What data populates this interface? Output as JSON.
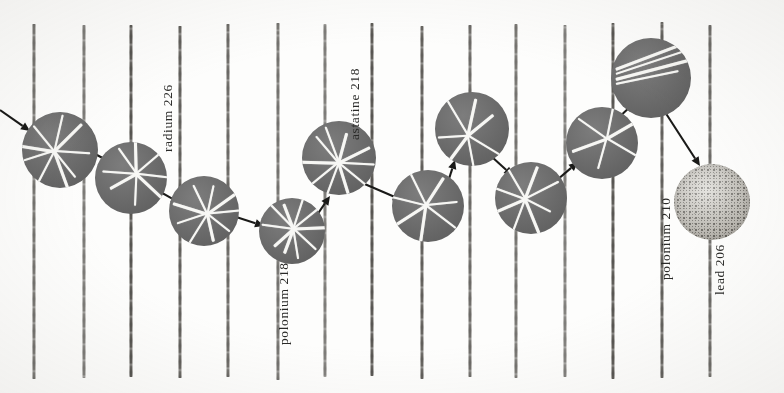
{
  "figure": {
    "background_color": "#fdfdfc",
    "disc_color": "#6e6e6e",
    "track_color": "#f7f7f4",
    "rod_color": "#3c3a36",
    "lead_disc_color": "#cfcdc6",
    "label_color": "#2a2a28"
  },
  "labels": [
    {
      "text": "radium 226",
      "x": 160,
      "y": 152
    },
    {
      "text": "polonium 218",
      "x": 276,
      "y": 345
    },
    {
      "text": "astatine 218",
      "x": 347,
      "y": 140
    },
    {
      "text": "polonium 210",
      "x": 658,
      "y": 280
    },
    {
      "text": "lead 206",
      "x": 712,
      "y": 295
    }
  ],
  "rods": [
    {
      "x": 34,
      "top": 24,
      "bottom": 379
    },
    {
      "x": 84,
      "top": 25,
      "bottom": 378
    },
    {
      "x": 131,
      "top": 25,
      "bottom": 377
    },
    {
      "x": 180,
      "top": 26,
      "bottom": 378
    },
    {
      "x": 228,
      "top": 24,
      "bottom": 377
    },
    {
      "x": 278,
      "top": 23,
      "bottom": 380
    },
    {
      "x": 325,
      "top": 24,
      "bottom": 377
    },
    {
      "x": 372,
      "top": 23,
      "bottom": 376
    },
    {
      "x": 422,
      "top": 26,
      "bottom": 379
    },
    {
      "x": 470,
      "top": 25,
      "bottom": 377
    },
    {
      "x": 516,
      "top": 24,
      "bottom": 378
    },
    {
      "x": 565,
      "top": 25,
      "bottom": 377
    },
    {
      "x": 613,
      "top": 23,
      "bottom": 379
    },
    {
      "x": 662,
      "top": 22,
      "bottom": 378
    },
    {
      "x": 710,
      "top": 25,
      "bottom": 377
    }
  ],
  "discs": [
    {
      "id": "disc-1",
      "cx": 60,
      "cy": 150,
      "r": 38,
      "type": "star",
      "tracks": 9,
      "seed": 1
    },
    {
      "id": "disc-2",
      "cx": 131,
      "cy": 178,
      "r": 36,
      "type": "star",
      "tracks": 8,
      "seed": 2
    },
    {
      "id": "disc-3",
      "cx": 204,
      "cy": 211,
      "r": 35,
      "type": "star",
      "tracks": 9,
      "seed": 3
    },
    {
      "id": "disc-4",
      "cx": 292,
      "cy": 231,
      "r": 33,
      "type": "star",
      "tracks": 10,
      "seed": 4
    },
    {
      "id": "disc-5",
      "cx": 339,
      "cy": 158,
      "r": 37,
      "type": "star",
      "tracks": 10,
      "seed": 5
    },
    {
      "id": "disc-6",
      "cx": 428,
      "cy": 206,
      "r": 36,
      "type": "star",
      "tracks": 7,
      "seed": 6
    },
    {
      "id": "disc-7",
      "cx": 472,
      "cy": 129,
      "r": 37,
      "type": "star",
      "tracks": 7,
      "seed": 7
    },
    {
      "id": "disc-8",
      "cx": 531,
      "cy": 198,
      "r": 36,
      "type": "star",
      "tracks": 8,
      "seed": 8
    },
    {
      "id": "disc-9",
      "cx": 602,
      "cy": 143,
      "r": 36,
      "type": "star",
      "tracks": 6,
      "seed": 9
    },
    {
      "id": "disc-10",
      "cx": 651,
      "cy": 78,
      "r": 40,
      "type": "streak",
      "tracks": 4,
      "seed": 10
    },
    {
      "id": "disc-11",
      "cx": 712,
      "cy": 202,
      "r": 38,
      "type": "lead",
      "tracks": 0,
      "seed": 11
    }
  ],
  "arrows": [
    {
      "id": "arrow-in",
      "x1": 0,
      "y1": 110,
      "x2": 30,
      "y2": 131
    },
    {
      "id": "arrow-1-2",
      "x1": 78,
      "y1": 145,
      "x2": 112,
      "y2": 163
    },
    {
      "id": "arrow-2-3",
      "x1": 148,
      "y1": 185,
      "x2": 180,
      "y2": 203
    },
    {
      "id": "arrow-3-4",
      "x1": 230,
      "y1": 215,
      "x2": 264,
      "y2": 226
    },
    {
      "id": "arrow-4-5",
      "x1": 317,
      "y1": 215,
      "x2": 330,
      "y2": 196
    },
    {
      "id": "arrow-5-6",
      "x1": 360,
      "y1": 182,
      "x2": 402,
      "y2": 200
    },
    {
      "id": "arrow-6-7",
      "x1": 447,
      "y1": 185,
      "x2": 455,
      "y2": 160
    },
    {
      "id": "arrow-7-8",
      "x1": 492,
      "y1": 157,
      "x2": 513,
      "y2": 176
    },
    {
      "id": "arrow-8-9",
      "x1": 557,
      "y1": 180,
      "x2": 578,
      "y2": 162
    },
    {
      "id": "arrow-9-10",
      "x1": 614,
      "y1": 122,
      "x2": 634,
      "y2": 103
    },
    {
      "id": "arrow-10-11",
      "x1": 665,
      "y1": 112,
      "x2": 700,
      "y2": 166
    }
  ]
}
